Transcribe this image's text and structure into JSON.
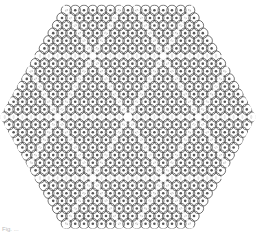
{
  "figure": {
    "type": "hexagonal circle-packing lattice",
    "shape": "hexagon",
    "center": [
      128,
      117
    ],
    "vertices": [
      [
        4,
        117
      ],
      [
        64,
        8
      ],
      [
        194,
        8
      ],
      [
        252,
        117
      ],
      [
        194,
        225
      ],
      [
        64,
        225
      ]
    ],
    "circle_spacing": 8.8,
    "circle_radius": 5.2,
    "stroke_color": "#444444",
    "fill_color": "#ffffff",
    "seam_color": "#ffffff",
    "seam_lines": "triangular grid of white seams dividing the hexagon into sub-regions, converging at the center"
  },
  "caption": {
    "text": "Fig. ..."
  }
}
